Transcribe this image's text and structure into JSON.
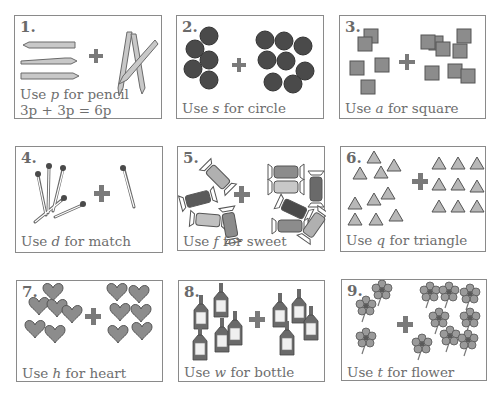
{
  "worksheet": {
    "cards": [
      {
        "number": "1.",
        "caption_pre": "Use ",
        "variable": "p",
        "caption_post": " for pencil",
        "item": "pencil",
        "left_count": 3,
        "right_count": 3,
        "equation": "3p + 3p = 6p"
      },
      {
        "number": "2.",
        "caption_pre": "Use ",
        "variable": "s",
        "caption_post": " for circle",
        "item": "circle",
        "left_count": 6,
        "right_count": 8
      },
      {
        "number": "3.",
        "caption_pre": "Use ",
        "variable": "a",
        "caption_post": " for square",
        "item": "square",
        "left_count": 5,
        "right_count": 7
      },
      {
        "number": "4.",
        "caption_pre": "Use ",
        "variable": "d",
        "caption_post": " for match",
        "item": "match",
        "left_count": 5,
        "right_count": 1
      },
      {
        "number": "5.",
        "caption_pre": "Use ",
        "variable": "f",
        "caption_post": " for sweet",
        "item": "sweet",
        "left_count": 4,
        "right_count": 6
      },
      {
        "number": "6.",
        "caption_pre": "Use ",
        "variable": "q",
        "caption_post": " for triangle",
        "item": "triangle",
        "left_count": 10,
        "right_count": 9
      },
      {
        "number": "7.",
        "caption_pre": "Use ",
        "variable": "h",
        "caption_post": " for heart",
        "item": "heart",
        "left_count": 6,
        "right_count": 6
      },
      {
        "number": "8.",
        "caption_pre": "Use ",
        "variable": "w",
        "caption_post": " for bottle",
        "item": "bottle",
        "left_count": 5,
        "right_count": 4
      },
      {
        "number": "9.",
        "caption_pre": "Use ",
        "variable": "t",
        "caption_post": " for flower",
        "item": "flower",
        "left_count": 3,
        "right_count": 8
      }
    ],
    "plus_symbol": "+",
    "colors": {
      "border": "#8a8a8a",
      "text": "#6e6e6e",
      "dark_fill": "#4a4a4a",
      "mid_fill": "#8c8c8c",
      "light_fill": "#b8b8b8"
    }
  }
}
